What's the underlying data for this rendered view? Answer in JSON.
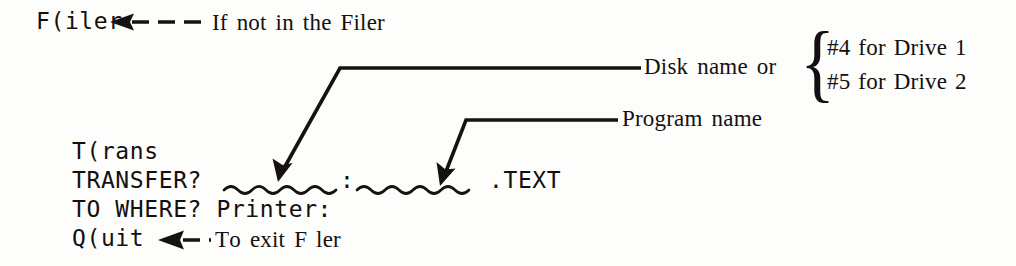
{
  "figure": {
    "background_color": "#fdfdfc",
    "ink_color": "#16120f"
  },
  "menu": {
    "filer_option": "F(iler",
    "trans_option": "T(rans",
    "quit_option": "Q(uit"
  },
  "prompts": {
    "transfer_label": "TRANSFER?",
    "transfer_separator": ":",
    "transfer_suffix": ".TEXT",
    "destination_line": "TO WHERE? Printer:"
  },
  "annotations": {
    "filer_note": "If not in the Filer",
    "quit_note": "To exit F ler",
    "disk_name_label": "Disk name or",
    "program_name_label": "Program name",
    "drive_options": [
      "#4 for Drive 1",
      "#5 for Drive 2"
    ],
    "brace_glyph": "{"
  }
}
